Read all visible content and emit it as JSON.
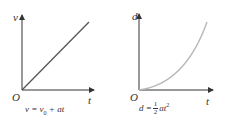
{
  "graphs": [
    {
      "name": "velocity-time",
      "y_label": "v",
      "x_label": "t",
      "origin_label": "O",
      "equation": {
        "lhs": "v = v",
        "sub": "0",
        "rhs": " + at"
      },
      "line_color": "#555555"
    },
    {
      "name": "displacement-time",
      "y_label": "d",
      "x_label": "t",
      "origin_label": "O",
      "equation": {
        "lhs": "d =",
        "frac_num": "1",
        "frac_den": "2",
        "rhs": "at",
        "sup": "2"
      },
      "line_color": "#b8b8b8"
    }
  ]
}
